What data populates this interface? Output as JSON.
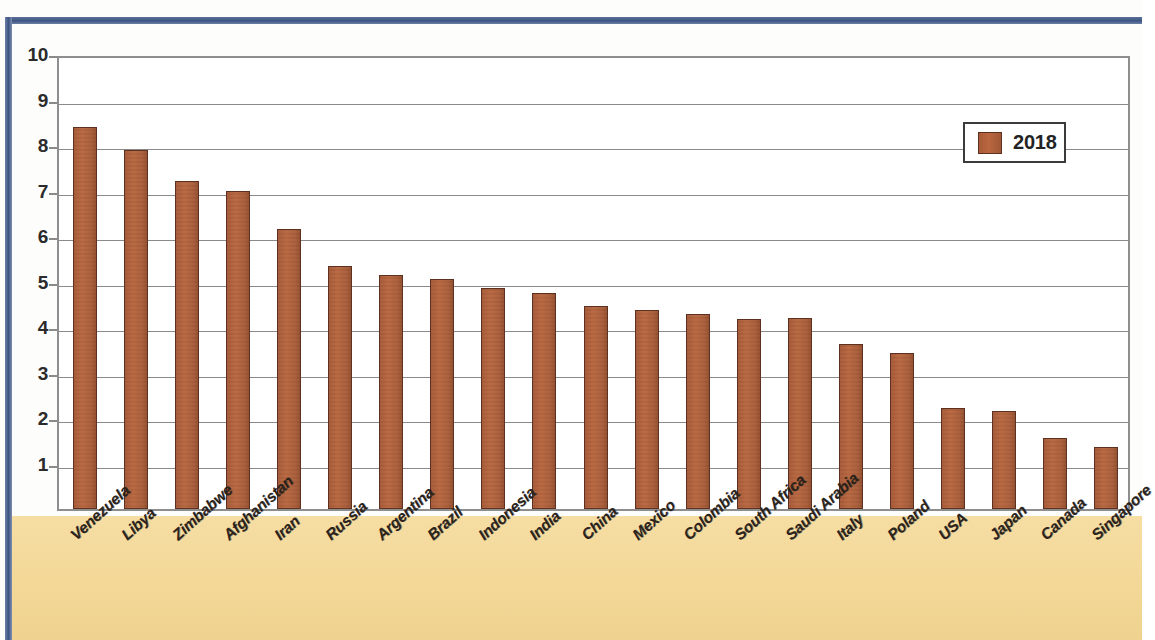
{
  "chart_data": {
    "type": "bar",
    "title": "",
    "xlabel": "",
    "ylabel": "",
    "ylim": [
      0,
      10
    ],
    "yticks": [
      10,
      9,
      8,
      7,
      6,
      5,
      4,
      3,
      2,
      1
    ],
    "grid": true,
    "legend_position": "top-right",
    "series_name": "2018",
    "bar_color": "#b05f3c",
    "categories": [
      "Venezuela",
      "Libya",
      "Zimbabwe",
      "Afghanistan",
      "Iran",
      "Russia",
      "Argentina",
      "Brazil",
      "Indonesia",
      "India",
      "China",
      "Mexico",
      "Colombia",
      "South Africa",
      "Saudi Arabia",
      "Italy",
      "Poland",
      "USA",
      "Japan",
      "Canada",
      "Singapore"
    ],
    "values": [
      8.4,
      7.9,
      7.2,
      7.0,
      6.15,
      5.35,
      5.15,
      5.05,
      4.85,
      4.75,
      4.47,
      4.38,
      4.28,
      4.18,
      4.2,
      3.63,
      3.43,
      2.23,
      2.15,
      1.55,
      1.37
    ],
    "series": [
      {
        "name": "2018",
        "values": [
          8.4,
          7.9,
          7.2,
          7.0,
          6.15,
          5.35,
          5.15,
          5.05,
          4.85,
          4.75,
          4.47,
          4.38,
          4.28,
          4.18,
          4.2,
          3.63,
          3.43,
          2.23,
          2.15,
          1.55,
          1.37
        ]
      }
    ]
  },
  "legend": {
    "label": "2018"
  },
  "colors": {
    "bar": "#b05f3c",
    "bar_edge": "#5d3120",
    "band": "#f3d99b",
    "gridline": "#8a8a8a",
    "frame": "#8e8e8e",
    "scan_border": "#3e5583"
  }
}
